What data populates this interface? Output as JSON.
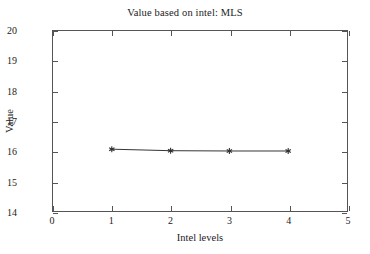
{
  "chart_data": {
    "type": "line",
    "title": "Value based on intel: MLS",
    "xlabel": "Intel levels",
    "ylabel": "Value",
    "xlim": [
      0,
      5
    ],
    "ylim": [
      14,
      20
    ],
    "xticks": [
      0,
      1,
      2,
      3,
      4,
      5
    ],
    "yticks": [
      14,
      15,
      16,
      17,
      18,
      19,
      20
    ],
    "xtick_labels": [
      "0",
      "1",
      "2",
      "3",
      "4",
      "5"
    ],
    "ytick_labels": [
      "14",
      "15",
      "16",
      "17",
      "18",
      "19",
      "20"
    ],
    "grid": false,
    "legend": null,
    "series": [
      {
        "name": "MLS",
        "marker": "asterisk",
        "color": "#333333",
        "x": [
          1,
          2,
          3,
          4
        ],
        "values": [
          16.06,
          16.01,
          16.0,
          16.0
        ]
      }
    ]
  },
  "figure": {
    "background_color": "#ffffff",
    "frame_color": "#555555",
    "text_color": "#222222"
  }
}
